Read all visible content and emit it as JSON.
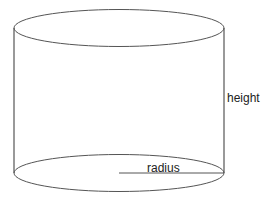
{
  "diagram": {
    "labels": {
      "height": "height",
      "radius": "radius"
    },
    "stroke_color": "#555555",
    "text_color": "#222222",
    "background": "#ffffff"
  }
}
